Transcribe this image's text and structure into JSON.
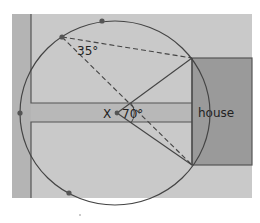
{
  "diagram": {
    "labels": {
      "house": "house",
      "center_point": "X",
      "center_angle": "70°",
      "inscribed_angle": "35°"
    },
    "colors": {
      "background": "#c9c9c9",
      "left_strip": "#b4b4b4",
      "road": "#b8b8b8",
      "house": "#9a9a9a",
      "lines": "#444444",
      "points": "#555555"
    },
    "circle": {
      "cx": 115,
      "cy": 113,
      "rx": 95,
      "ry": 92
    },
    "points": [
      {
        "name": "top",
        "x": 102,
        "y": 21
      },
      {
        "name": "upper-left",
        "x": 62,
        "y": 37
      },
      {
        "name": "left",
        "x": 20,
        "y": 113
      },
      {
        "name": "bottom-left",
        "x": 69,
        "y": 193
      }
    ],
    "angles": {
      "center": 70,
      "inscribed": 35
    }
  }
}
